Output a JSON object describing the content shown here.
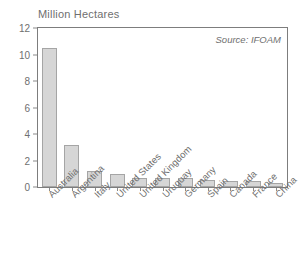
{
  "chart_data": {
    "type": "bar",
    "title": "Million Hectares",
    "xlabel": "",
    "ylabel": "Million Hectares",
    "ylim": [
      0,
      12
    ],
    "yticks": [
      0,
      2,
      4,
      6,
      8,
      10,
      12
    ],
    "ytick_labels": [
      "0",
      "2",
      "4",
      "6",
      "8",
      "10",
      "12"
    ],
    "grid": false,
    "legend": null,
    "annotations": [
      {
        "text": "Source: IFOAM",
        "position": "top-right-inside-plot",
        "style": "italic"
      }
    ],
    "categories": [
      "Australia",
      "Argentina",
      "Italy",
      "United States",
      "United Kingdom",
      "Uruguay",
      "Germany",
      "Spain",
      "Canada",
      "France",
      "China"
    ],
    "values": [
      10.5,
      3.2,
      1.2,
      0.95,
      0.65,
      0.65,
      0.65,
      0.5,
      0.42,
      0.42,
      0.27
    ],
    "bar_fill_color": "#d6d6d6",
    "bar_border_color": "#a5a5a5",
    "axis_color": "#7d7d7d",
    "text_color": "#6f6f6f",
    "background_color": "#ffffff"
  },
  "chart": {
    "title": "Million Hectares",
    "source_note": "Source: IFOAM"
  }
}
